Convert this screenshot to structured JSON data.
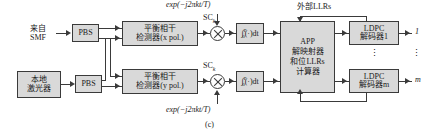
{
  "figure": {
    "caption": "(c)",
    "external_llrs_label": "外部LLRs"
  },
  "inputs": {
    "smf": {
      "line1": "来自",
      "line2": "SMF"
    },
    "local_laser": {
      "line1": "本地",
      "line2": "激光器"
    }
  },
  "pbs": {
    "top_label": "PBS",
    "bottom_label": "PBS"
  },
  "detectors": {
    "x_pol": {
      "line1": "平衡相干",
      "line2": "检测器(x pol.)"
    },
    "y_pol": {
      "line1": "平衡相干",
      "line2": "检测器(y pol.)"
    }
  },
  "mixers": {
    "top": {
      "icon": "multiplier-icon",
      "carrier_label": "exp(−j2πkt/T)",
      "subcarrier_label": "SC",
      "subcarrier_index": "k"
    },
    "bottom": {
      "icon": "multiplier-icon",
      "carrier_label": "exp(−j2πkt/T)",
      "subcarrier_label": "SC",
      "subcarrier_index": "k"
    }
  },
  "integrators": {
    "top": {
      "symbol": "∫",
      "upper_limit": "T",
      "lower_limit": "0",
      "body": "(·)dt"
    },
    "bottom": {
      "symbol": "∫",
      "upper_limit": "T",
      "lower_limit": "0",
      "body": "(·)dt"
    }
  },
  "app_block": {
    "line1": "APP",
    "line2": "解映射器",
    "line3": "和位LLRs",
    "line4": "计算器"
  },
  "decoders": [
    {
      "line1": "LDPC",
      "line2": "解码器1",
      "output": "1"
    },
    {
      "line1": "LDPC",
      "line2": "解码器m",
      "output": "m"
    }
  ],
  "ellipsis": {
    "glyph": "⋮"
  },
  "colors": {
    "block_fill": "#d9d9d9",
    "stroke": "#3a3a3a",
    "background": "#ffffff"
  }
}
